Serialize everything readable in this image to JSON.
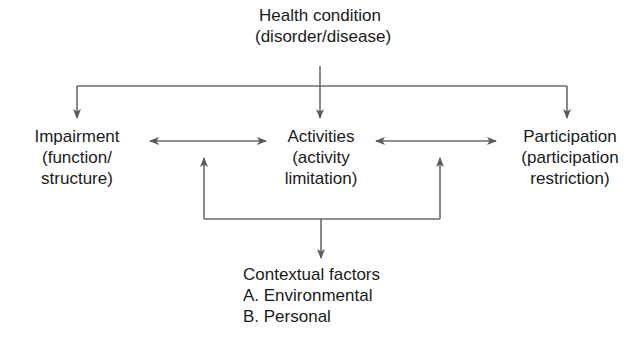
{
  "diagram": {
    "nodes": {
      "health_condition": {
        "line1": "Health condition",
        "line2": "(disorder/disease)"
      },
      "impairment": {
        "line1": "Impairment",
        "line2": "(function/",
        "line3": "structure)"
      },
      "activities": {
        "line1": "Activities",
        "line2": "(activity",
        "line3": "limitation)"
      },
      "participation": {
        "line1": "Participation",
        "line2": "(participation",
        "line3": "restriction)"
      },
      "contextual": {
        "line1": "Contextual factors",
        "line2": "A. Environmental",
        "line3": "B. Personal"
      }
    },
    "edges": [
      {
        "from": "health_condition",
        "to": "impairment",
        "type": "arrow"
      },
      {
        "from": "health_condition",
        "to": "activities",
        "type": "arrow"
      },
      {
        "from": "health_condition",
        "to": "participation",
        "type": "arrow"
      },
      {
        "from": "impairment",
        "to": "activities",
        "type": "bidirectional"
      },
      {
        "from": "activities",
        "to": "participation",
        "type": "bidirectional"
      },
      {
        "from": "contextual",
        "to": "impairment-activities-link",
        "type": "bidirectional"
      },
      {
        "from": "contextual",
        "to": "activities-participation-link",
        "type": "bidirectional"
      }
    ],
    "colors": {
      "line": "#5a5a5a",
      "text": "#1a1a1a",
      "background": "#ffffff"
    }
  }
}
